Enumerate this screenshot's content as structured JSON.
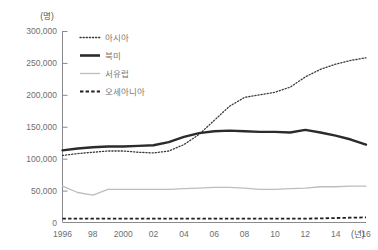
{
  "chart_data": {
    "type": "line",
    "title": "",
    "xlabel": "(년)",
    "ylabel": "(명)",
    "y_unit": "(명)",
    "x_unit": "(년)",
    "xlim": [
      1996,
      2016
    ],
    "ylim": [
      0,
      300000
    ],
    "grid": false,
    "legend_position": "top-left-inside",
    "ytick_labels": [
      "300,000",
      "250,000",
      "200,000",
      "150,000",
      "100,000",
      "50,000",
      "0"
    ],
    "ytick_values": [
      300000,
      250000,
      200000,
      150000,
      100000,
      50000,
      0
    ],
    "xtick_labels": [
      "1996",
      "98",
      "2000",
      "02",
      "04",
      "06",
      "08",
      "10",
      "12",
      "14",
      "16"
    ],
    "xtick_values": [
      1996,
      1998,
      2000,
      2002,
      2004,
      2006,
      2008,
      2010,
      2012,
      2014,
      2016
    ],
    "x": [
      1996,
      1997,
      1998,
      1999,
      2000,
      2001,
      2002,
      2003,
      2004,
      2005,
      2006,
      2007,
      2008,
      2009,
      2010,
      2011,
      2012,
      2013,
      2014,
      2015,
      2016
    ],
    "series": [
      {
        "name": "아시아",
        "style": "dotted",
        "color": "#3a3a3a",
        "values": [
          105000,
          108000,
          110000,
          112000,
          112000,
          110000,
          109000,
          112000,
          122000,
          138000,
          160000,
          182000,
          196000,
          200000,
          204000,
          212000,
          228000,
          240000,
          248000,
          254000,
          258000
        ]
      },
      {
        "name": "북미",
        "style": "solid-thick",
        "color": "#2b2b2b",
        "values": [
          113000,
          116000,
          118000,
          119000,
          119000,
          120000,
          121000,
          126000,
          134000,
          140000,
          143000,
          144000,
          143000,
          142000,
          142000,
          141000,
          145000,
          141000,
          136000,
          130000,
          122000
        ]
      },
      {
        "name": "서유럽",
        "style": "solid-thin",
        "color": "#bdbdbd",
        "values": [
          57000,
          47000,
          43000,
          52000,
          52000,
          52000,
          52000,
          52000,
          53000,
          54000,
          55000,
          55000,
          54000,
          52000,
          52000,
          53000,
          54000,
          56000,
          56000,
          57000,
          57000
        ]
      },
      {
        "name": "오세아니아",
        "style": "dashed",
        "color": "#1f1f1f",
        "values": [
          6000,
          6000,
          6000,
          6000,
          6000,
          6000,
          6000,
          6000,
          6000,
          6000,
          6000,
          6000,
          6000,
          6000,
          6000,
          6000,
          6000,
          6500,
          7000,
          7500,
          8000
        ]
      }
    ]
  },
  "legend": {
    "items": [
      {
        "label": "아시아"
      },
      {
        "label": "북미"
      },
      {
        "label": "서유럽"
      },
      {
        "label": "오세아니아"
      }
    ]
  }
}
